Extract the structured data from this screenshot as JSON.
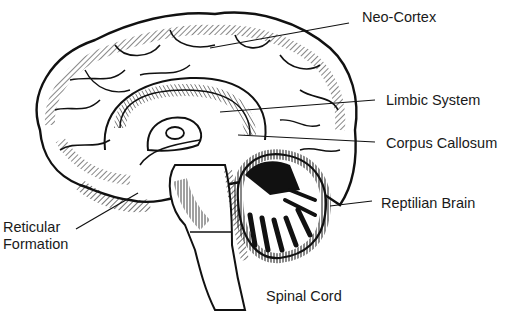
{
  "diagram": {
    "colors": {
      "ink": "#111111",
      "background": "#ffffff",
      "text": "#1a1a1a"
    },
    "labels": [
      {
        "id": "neo-cortex",
        "text": "Neo-Cortex",
        "x": 362,
        "y": 9
      },
      {
        "id": "limbic-system",
        "text": "Limbic System",
        "x": 386,
        "y": 92
      },
      {
        "id": "corpus-callosum",
        "text": "Corpus Callosum",
        "x": 386,
        "y": 135
      },
      {
        "id": "reptilian-brain",
        "text": "Reptilian Brain",
        "x": 381,
        "y": 195
      },
      {
        "id": "reticular-formation",
        "line1": "Reticular",
        "line2": "Formation",
        "x": 3,
        "y": 219
      },
      {
        "id": "spinal-cord",
        "text": "Spinal Cord",
        "x": 266,
        "y": 288
      }
    ],
    "leader_lines": [
      {
        "id": "neo-cortex-line",
        "x1": 349,
        "y1": 23,
        "x2": 210,
        "y2": 48
      },
      {
        "id": "limbic-system-line",
        "x1": 375,
        "y1": 100,
        "x2": 220,
        "y2": 112
      },
      {
        "id": "corpus-callosum-line",
        "x1": 375,
        "y1": 142,
        "x2": 238,
        "y2": 135
      },
      {
        "id": "reptilian-brain-line",
        "x1": 372,
        "y1": 201,
        "x2": 330,
        "y2": 206
      },
      {
        "id": "reticular-formation-line",
        "x1": 76,
        "y1": 229,
        "x2": 138,
        "y2": 193
      }
    ]
  }
}
